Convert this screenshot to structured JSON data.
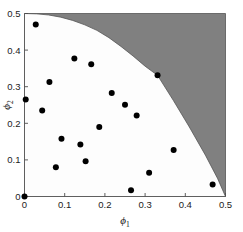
{
  "chart_data": {
    "type": "scatter",
    "title": "",
    "subtitle": "",
    "xlabel": "ϕ",
    "xlabel_sub": "1",
    "ylabel": "ϕ",
    "ylabel_sub": "2",
    "xlim": [
      0,
      0.5
    ],
    "ylim": [
      0,
      0.5
    ],
    "xticks": [
      0,
      0.1,
      0.2,
      0.3,
      0.4,
      0.5
    ],
    "xticklabels": [
      "0",
      "0.1",
      "0.2",
      "0.3",
      "0.4",
      "0.5"
    ],
    "yticks": [
      0,
      0.1,
      0.2,
      0.3,
      0.4,
      0.5
    ],
    "yticklabels": [
      "0",
      "0.1",
      "0.2",
      "0.3",
      "0.4",
      "0.5"
    ],
    "grid": false,
    "legend": null,
    "legend_position": "none",
    "marker": "filled-circle",
    "marker_color": "#000000",
    "marker_size": 3.0,
    "series": [
      {
        "name": "samples",
        "points": [
          [
            0.0,
            0.0
          ],
          [
            0.003,
            0.265
          ],
          [
            0.028,
            0.47
          ],
          [
            0.044,
            0.235
          ],
          [
            0.062,
            0.313
          ],
          [
            0.078,
            0.08
          ],
          [
            0.092,
            0.158
          ],
          [
            0.124,
            0.377
          ],
          [
            0.139,
            0.142
          ],
          [
            0.152,
            0.096
          ],
          [
            0.166,
            0.361
          ],
          [
            0.186,
            0.19
          ],
          [
            0.217,
            0.283
          ],
          [
            0.25,
            0.251
          ],
          [
            0.265,
            0.017
          ],
          [
            0.279,
            0.221
          ],
          [
            0.31,
            0.065
          ],
          [
            0.331,
            0.331
          ],
          [
            0.371,
            0.127
          ],
          [
            0.468,
            0.033
          ]
        ]
      }
    ],
    "shaded_region": {
      "name": "infeasible-region",
      "fill_color": "#808080",
      "edge_color": "#555555",
      "description": "Shaded region above and right of the boundary curve",
      "boundary_points": [
        [
          0.0,
          0.5
        ],
        [
          0.03,
          0.499
        ],
        [
          0.06,
          0.496
        ],
        [
          0.09,
          0.49
        ],
        [
          0.12,
          0.481
        ],
        [
          0.15,
          0.469
        ],
        [
          0.18,
          0.454
        ],
        [
          0.21,
          0.434
        ],
        [
          0.24,
          0.41
        ],
        [
          0.27,
          0.384
        ],
        [
          0.3,
          0.356
        ],
        [
          0.331,
          0.331
        ],
        [
          0.37,
          0.263
        ],
        [
          0.41,
          0.19
        ],
        [
          0.45,
          0.113
        ],
        [
          0.48,
          0.05
        ],
        [
          0.5,
          0.0
        ]
      ]
    },
    "annotations": []
  },
  "figure": {
    "background_color": "#ffffff",
    "plot_background_color": "#fdfdfd",
    "axis_color": "#4d4d4d"
  }
}
